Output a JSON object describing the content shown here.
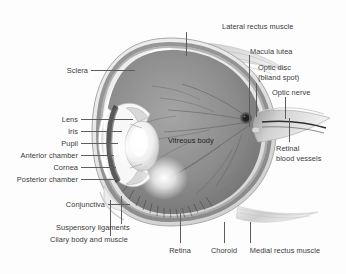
{
  "figure": {
    "title": "Eye anatomy",
    "style": "grayscale medical illustration",
    "background_color": "#fdfdfd",
    "title_color": "#2b2b2b",
    "label_color": "#3a3a3a",
    "leader_color": "#5d5d5d"
  },
  "inner_labels": [
    {
      "id": "vitreous-body",
      "text": "Vitreous body",
      "x": 168,
      "y": 136
    }
  ],
  "labels_left": [
    {
      "id": "sclera",
      "text": "Sclera",
      "right": 258,
      "top": 66,
      "line_x1": 91,
      "line_x2": 135,
      "line_y": 70
    },
    {
      "id": "lens",
      "text": "Lens",
      "right": 268,
      "top": 115,
      "line_x1": 81,
      "line_x2": 133,
      "line_y": 119
    },
    {
      "id": "iris",
      "text": "Iris",
      "right": 268,
      "top": 127,
      "line_x1": 81,
      "line_x2": 122,
      "line_y": 131
    },
    {
      "id": "pupil",
      "text": "Pupil",
      "right": 268,
      "top": 139,
      "line_x1": 81,
      "line_x2": 118,
      "line_y": 143
    },
    {
      "id": "anterior-chamber",
      "text": "Anterior chamber",
      "right": 268,
      "top": 151,
      "line_x1": 81,
      "line_x2": 114,
      "line_y": 155
    },
    {
      "id": "cornea",
      "text": "Cornea",
      "right": 268,
      "top": 163,
      "line_x1": 81,
      "line_x2": 116,
      "line_y": 167
    },
    {
      "id": "posterior-chamber",
      "text": "Posterior chamber",
      "right": 268,
      "top": 175,
      "line_x1": 81,
      "line_x2": 118,
      "line_y": 179
    },
    {
      "id": "conjunctiva",
      "text": "Conjunctiva",
      "right": 241,
      "top": 200,
      "line_x1": 108,
      "line_x2": 130,
      "line_y": 204
    }
  ],
  "labels_left_lower": [
    {
      "id": "suspensory-ligaments",
      "text": "Suspensory ligaments",
      "left": 56,
      "top": 223
    },
    {
      "id": "cilary-body-and-muscle",
      "text": "Cilary body and muscle",
      "left": 50,
      "top": 235
    }
  ],
  "labels_right_top": [
    {
      "id": "lateral-rectus-muscle",
      "text": "Lateral rectus muscle",
      "left": 222,
      "top": 22,
      "arrow_x": 186,
      "arrow_y1": 32,
      "arrow_y2": 54
    },
    {
      "id": "macula-lutea",
      "text": "Macula lutea",
      "left": 250,
      "top": 47
    },
    {
      "id": "optic-disc",
      "line1": "Optic disc",
      "line2": "(bliand spot)",
      "left": 258,
      "top": 63
    },
    {
      "id": "optic-nerve",
      "text": "Optic nerve",
      "left": 272,
      "top": 88
    }
  ],
  "labels_right": [
    {
      "id": "retinal-blood-vessels",
      "line1": "Retinal",
      "line2": "blood vessels",
      "left": 276,
      "top": 144
    }
  ],
  "labels_bottom": [
    {
      "id": "retina",
      "text": "Retina",
      "center": 180,
      "top": 246,
      "line_x": 180,
      "line_y1": 213,
      "line_y2": 243
    },
    {
      "id": "choroid",
      "text": "Choroid",
      "center": 224,
      "top": 246,
      "line_x": 224,
      "line_y1": 222,
      "line_y2": 243
    },
    {
      "id": "medial-rectus-muscle",
      "text": "Medial rectus muscle",
      "center": 285,
      "top": 246,
      "line_x": 250,
      "line_y1": 226,
      "line_y2": 243
    }
  ]
}
